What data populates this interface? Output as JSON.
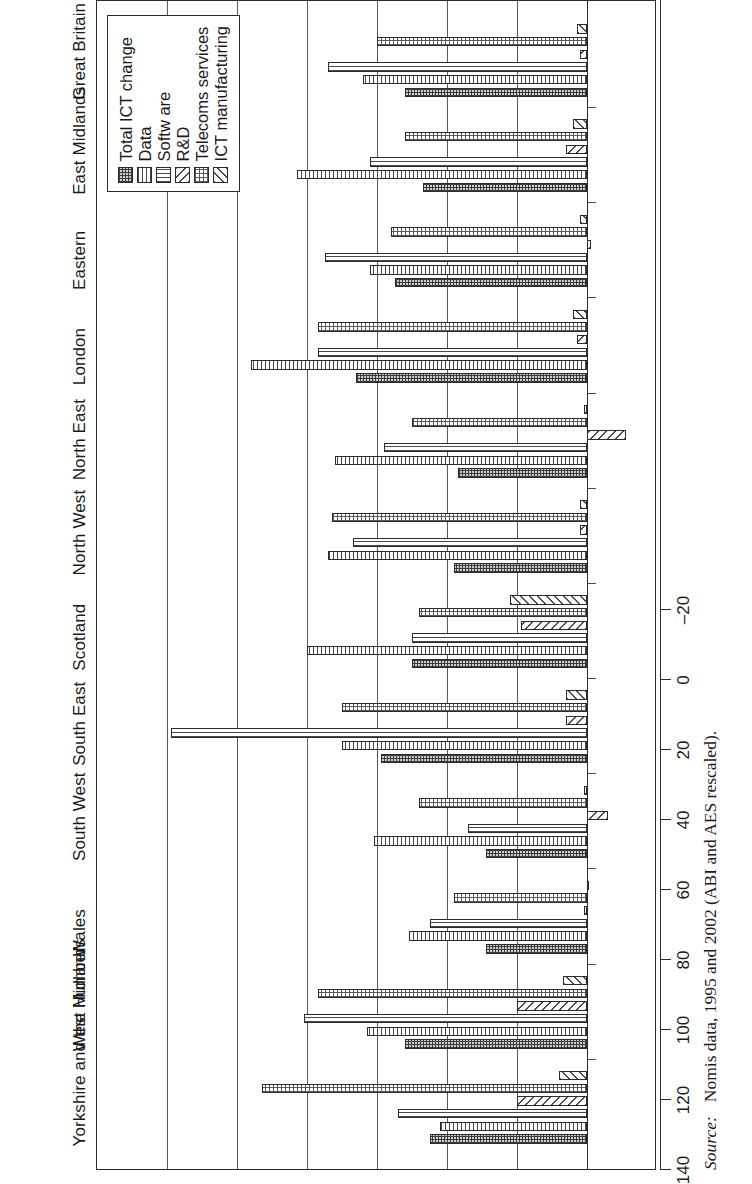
{
  "figure": {
    "source_label": "Source:",
    "source_text": "Nomis data, 1995 and 2002 (ABI and AES rescaled)."
  },
  "legend": {
    "items": [
      {
        "label": "Total ICT change",
        "pattern": "p-total"
      },
      {
        "label": "Data",
        "pattern": "p-data"
      },
      {
        "label": "Softw are",
        "pattern": "p-soft"
      },
      {
        "label": "R&D",
        "pattern": "p-rd"
      },
      {
        "label": "Telecoms services",
        "pattern": "p-tel"
      },
      {
        "label": "ICT manufacturing",
        "pattern": "p-ict"
      }
    ]
  },
  "chart_data": {
    "type": "bar",
    "title": "",
    "xlabel": "",
    "ylabel": "",
    "ylim": [
      -20,
      140
    ],
    "yticks": [
      -20,
      0,
      20,
      40,
      60,
      80,
      100,
      120,
      140
    ],
    "grid": true,
    "legend_position": "inside-right",
    "categories": [
      "Yorkshire and the Humber",
      "West Midlands",
      "Wales",
      "South West",
      "South East",
      "Scotland",
      "North West",
      "North East",
      "London",
      "Eastern",
      "East Midlands",
      "Great Britain"
    ],
    "series": [
      {
        "name": "Total ICT change",
        "values": [
          45,
          52,
          29,
          29,
          59,
          50,
          38,
          37,
          66,
          55,
          47,
          52
        ]
      },
      {
        "name": "Data",
        "values": [
          42,
          63,
          51,
          61,
          70,
          80,
          74,
          72,
          96,
          62,
          83,
          64
        ]
      },
      {
        "name": "Softw are",
        "values": [
          54,
          81,
          45,
          34,
          119,
          50,
          67,
          58,
          77,
          75,
          62,
          74
        ]
      },
      {
        "name": "R&D",
        "values": [
          20,
          20,
          1,
          -6,
          6,
          19,
          2,
          -11,
          3,
          -1,
          6,
          2
        ]
      },
      {
        "name": "Telecoms services",
        "values": [
          93,
          77,
          38,
          48,
          70,
          48,
          73,
          50,
          77,
          56,
          52,
          60
        ]
      },
      {
        "name": "ICT manufacturing",
        "values": [
          8,
          7,
          0,
          1,
          6,
          22,
          2,
          1,
          4,
          2,
          4,
          3
        ]
      }
    ]
  }
}
